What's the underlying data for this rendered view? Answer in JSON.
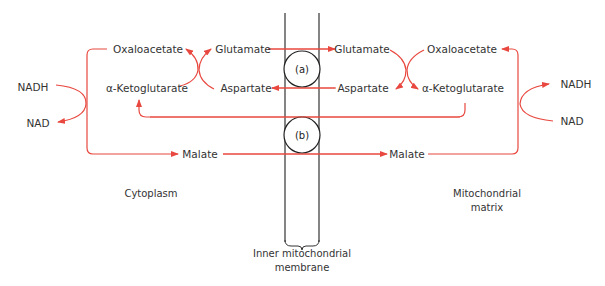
{
  "colors": {
    "arrow": "#e8483f",
    "membrane": "#333333",
    "text": "#333333",
    "background": "#ffffff"
  },
  "regions": {
    "cytoplasm": "Cytoplasm",
    "matrix_line1": "Mitochondrial",
    "matrix_line2": "matrix",
    "membrane_line1": "Inner mitochondrial",
    "membrane_line2": "membrane"
  },
  "transporters": {
    "a": "(a)",
    "b": "(b)"
  },
  "cytoplasm_side": {
    "oxaloacetate": "Oxaloacetate",
    "glutamate": "Glutamate",
    "alpha_ketoglutarate": "α-Ketoglutarate",
    "aspartate": "Aspartate",
    "malate": "Malate",
    "nadh": "NADH",
    "nad": "NAD"
  },
  "matrix_side": {
    "glutamate": "Glutamate",
    "oxaloacetate": "Oxaloacetate",
    "aspartate": "Aspartate",
    "alpha_ketoglutarate": "α-Ketoglutarate",
    "malate": "Malate",
    "nadh": "NADH",
    "nad": "NAD"
  }
}
